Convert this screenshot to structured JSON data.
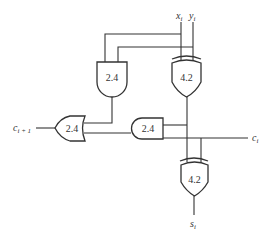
{
  "diagram": {
    "type": "full-adder-cell",
    "signals": {
      "x": {
        "base": "x",
        "sub": "i"
      },
      "y": {
        "base": "y",
        "sub": "i"
      },
      "carry_in": {
        "base": "c",
        "sub": "i"
      },
      "carry_out": {
        "base": "c",
        "sub": "i + 1"
      },
      "sum": {
        "base": "s",
        "sub": "i"
      }
    },
    "gates": [
      {
        "id": "and-top",
        "type": "AND",
        "delay": "2.4"
      },
      {
        "id": "xor-top",
        "type": "XOR",
        "delay": "4.2"
      },
      {
        "id": "or-carry",
        "type": "OR",
        "delay": "2.4"
      },
      {
        "id": "and-bottom",
        "type": "AND",
        "delay": "2.4"
      },
      {
        "id": "xor-bottom",
        "type": "XOR",
        "delay": "4.2"
      }
    ],
    "colors": {
      "stroke": "#333333",
      "background": "#ffffff"
    }
  }
}
